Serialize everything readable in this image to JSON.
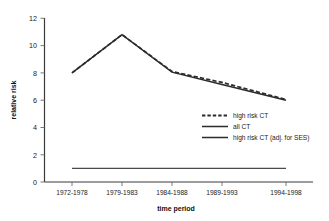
{
  "chart_data": {
    "type": "line",
    "title": "",
    "xlabel": "time period",
    "ylabel": "relative risk",
    "categories": [
      "1972-1978",
      "1979-1983",
      "1984-1988",
      "1989-1993",
      "1994-1998"
    ],
    "ylim": [
      0,
      12
    ],
    "ytick_labels": [
      "0",
      "2",
      "4",
      "6",
      "8",
      "10",
      "12"
    ],
    "ytick_values": [
      0,
      2,
      4,
      6,
      8,
      10,
      12
    ],
    "grid": false,
    "legend_position": "center-right",
    "series": [
      {
        "name": "high risk CT",
        "style": "dashed",
        "color": "#2b2b2b",
        "values": [
          8.0,
          10.8,
          8.1,
          7.3,
          6.05
        ]
      },
      {
        "name": "all CT",
        "style": "solid",
        "color": "#4a4a4a",
        "values": [
          1.0,
          1.0,
          1.0,
          1.0,
          1.0
        ]
      },
      {
        "name": "high risk CT (adj. for SES)",
        "style": "solid",
        "color": "#2b2b2b",
        "values": [
          8.0,
          10.8,
          8.05,
          7.15,
          6.0
        ]
      }
    ]
  },
  "axes": {
    "y_title": "relative risk",
    "x_title": "time period",
    "y_ticks": [
      "12",
      "10",
      "8",
      "6",
      "4",
      "2",
      "0"
    ],
    "x_ticks": [
      "1972-1978",
      "1979-1983",
      "1984-1988",
      "1989-1993",
      "1994-1998"
    ]
  },
  "legend": {
    "entries": [
      {
        "label": "high risk CT"
      },
      {
        "label": "all CT"
      },
      {
        "label": "high risk CT (adj. for SES)"
      }
    ]
  }
}
